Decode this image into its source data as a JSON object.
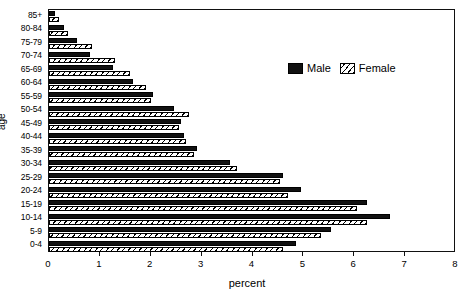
{
  "chart_data": {
    "type": "bar",
    "title": "",
    "subtitle": "",
    "orientation": "horizontal",
    "xlabel": "percent",
    "ylabel": "age",
    "xlim": [
      0,
      8
    ],
    "xticks": [
      0,
      1,
      2,
      3,
      4,
      5,
      6,
      7,
      8
    ],
    "xticklabels": [
      "0",
      "1",
      "2",
      "3",
      "4",
      "5",
      "6",
      "7",
      "8"
    ],
    "grid": false,
    "legend_position": "upper right inside",
    "categories": [
      "85+",
      "80-84",
      "75-79",
      "70-74",
      "65-69",
      "60-64",
      "55-59",
      "50-54",
      "45-49",
      "40-44",
      "35-39",
      "30-34",
      "25-29",
      "20-24",
      "15-19",
      "10-14",
      "5-9",
      "0-4"
    ],
    "series": [
      {
        "name": "Male",
        "color": "#111111",
        "pattern": "solid",
        "values": [
          0.12,
          0.3,
          0.55,
          0.8,
          1.25,
          1.65,
          2.05,
          2.45,
          2.6,
          2.65,
          2.9,
          3.55,
          4.6,
          4.95,
          6.25,
          6.7,
          5.55,
          4.85
        ]
      },
      {
        "name": "Female",
        "color": "#ffffff",
        "pattern": "diagonal-hatch",
        "values": [
          0.2,
          0.38,
          0.85,
          1.3,
          1.6,
          1.9,
          2.0,
          2.75,
          2.55,
          2.7,
          2.85,
          3.7,
          4.55,
          4.7,
          6.05,
          6.25,
          5.35,
          4.6
        ]
      }
    ]
  },
  "legend": {
    "items": [
      {
        "label": "Male"
      },
      {
        "label": "Female"
      }
    ]
  },
  "axes": {
    "x_title": "percent",
    "y_title": "age"
  }
}
